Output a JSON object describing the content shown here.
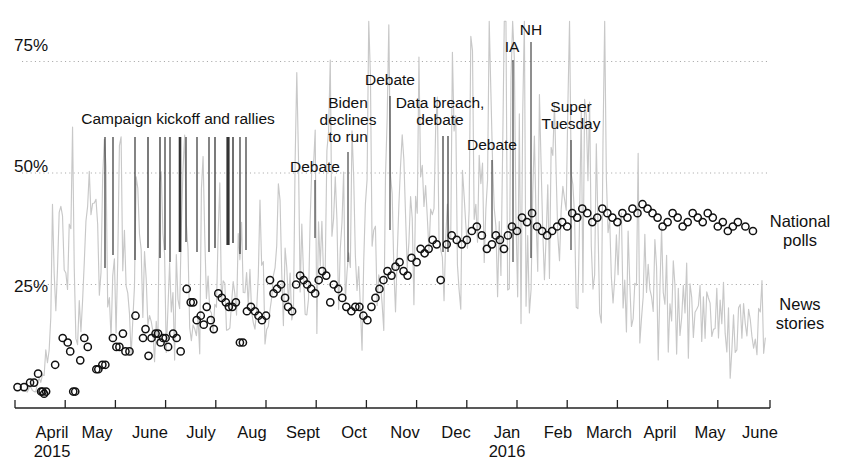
{
  "chart_data": {
    "type": "line",
    "title": "",
    "xlabel": "",
    "ylabel": "",
    "ylim": [
      0,
      85
    ],
    "grid": "horizontal dotted at 25%, 50%, 75%",
    "legend_position": "right, inline at series end",
    "y_ticks": [
      {
        "label": "75%",
        "value": 75
      },
      {
        "label": "50%",
        "value": 50
      },
      {
        "label": "25%",
        "value": 25
      }
    ],
    "x_ticks": [
      {
        "label": "April",
        "sub": "2015",
        "value": "2015-04"
      },
      {
        "label": "May",
        "sub": "",
        "value": "2015-05"
      },
      {
        "label": "June",
        "sub": "",
        "value": "2015-06"
      },
      {
        "label": "July",
        "sub": "",
        "value": "2015-07"
      },
      {
        "label": "Aug",
        "sub": "",
        "value": "2015-08"
      },
      {
        "label": "Sept",
        "sub": "",
        "value": "2015-09"
      },
      {
        "label": "Oct",
        "sub": "",
        "value": "2015-10"
      },
      {
        "label": "Nov",
        "sub": "",
        "value": "2015-11"
      },
      {
        "label": "Dec",
        "sub": "",
        "value": "2015-12"
      },
      {
        "label": "Jan",
        "sub": "2016",
        "value": "2016-01"
      },
      {
        "label": "Feb",
        "sub": "",
        "value": "2016-02"
      },
      {
        "label": "March",
        "sub": "",
        "value": "2016-03"
      },
      {
        "label": "April",
        "sub": "",
        "value": "2016-04"
      },
      {
        "label": "May",
        "sub": "",
        "value": "2016-05"
      },
      {
        "label": "June",
        "sub": "",
        "value": "2016-06"
      }
    ],
    "series": [
      {
        "name": "National polls",
        "type": "scatter",
        "marker": "open-circle",
        "color": "#111111",
        "label_text": "National\npolls",
        "points": [
          [
            0.05,
            2
          ],
          [
            0.18,
            2
          ],
          [
            0.3,
            3
          ],
          [
            0.38,
            3
          ],
          [
            0.46,
            5
          ],
          [
            0.52,
            1
          ],
          [
            0.55,
            1
          ],
          [
            0.58,
            0.5
          ],
          [
            0.62,
            1
          ],
          [
            0.8,
            7
          ],
          [
            0.95,
            13
          ],
          [
            1.05,
            12
          ],
          [
            1.1,
            10
          ],
          [
            1.16,
            1
          ],
          [
            1.2,
            1
          ],
          [
            1.3,
            8
          ],
          [
            1.38,
            13
          ],
          [
            1.45,
            11
          ],
          [
            1.62,
            6
          ],
          [
            1.66,
            6
          ],
          [
            1.74,
            7
          ],
          [
            1.8,
            7
          ],
          [
            1.95,
            13
          ],
          [
            2.02,
            11
          ],
          [
            2.08,
            11
          ],
          [
            2.15,
            14
          ],
          [
            2.2,
            10
          ],
          [
            2.28,
            10
          ],
          [
            2.4,
            18
          ],
          [
            2.55,
            13
          ],
          [
            2.6,
            15
          ],
          [
            2.66,
            9
          ],
          [
            2.72,
            13
          ],
          [
            2.8,
            14
          ],
          [
            2.85,
            14
          ],
          [
            2.9,
            12
          ],
          [
            2.95,
            13
          ],
          [
            3.0,
            13
          ],
          [
            3.05,
            11
          ],
          [
            3.15,
            14
          ],
          [
            3.22,
            13
          ],
          [
            3.3,
            10
          ],
          [
            3.42,
            24
          ],
          [
            3.5,
            21
          ],
          [
            3.55,
            21
          ],
          [
            3.62,
            17
          ],
          [
            3.7,
            18
          ],
          [
            3.76,
            16
          ],
          [
            3.82,
            20
          ],
          [
            3.9,
            17
          ],
          [
            3.96,
            15
          ],
          [
            4.05,
            23
          ],
          [
            4.12,
            22
          ],
          [
            4.2,
            21
          ],
          [
            4.26,
            20
          ],
          [
            4.33,
            20
          ],
          [
            4.4,
            21
          ],
          [
            4.48,
            12
          ],
          [
            4.54,
            12
          ],
          [
            4.62,
            19
          ],
          [
            4.7,
            20
          ],
          [
            4.78,
            19
          ],
          [
            4.85,
            18
          ],
          [
            4.92,
            17
          ],
          [
            5.0,
            18
          ],
          [
            5.08,
            26
          ],
          [
            5.15,
            23
          ],
          [
            5.22,
            24
          ],
          [
            5.3,
            25
          ],
          [
            5.38,
            22
          ],
          [
            5.44,
            20
          ],
          [
            5.52,
            19
          ],
          [
            5.6,
            25
          ],
          [
            5.68,
            27
          ],
          [
            5.75,
            26
          ],
          [
            5.82,
            25
          ],
          [
            5.9,
            24
          ],
          [
            5.98,
            23
          ],
          [
            6.05,
            26
          ],
          [
            6.12,
            28
          ],
          [
            6.2,
            27
          ],
          [
            6.28,
            21
          ],
          [
            6.35,
            25
          ],
          [
            6.44,
            24
          ],
          [
            6.52,
            22
          ],
          [
            6.6,
            20
          ],
          [
            6.7,
            19
          ],
          [
            6.78,
            20
          ],
          [
            6.86,
            20
          ],
          [
            6.94,
            18
          ],
          [
            7.02,
            17
          ],
          [
            7.1,
            20
          ],
          [
            7.18,
            22
          ],
          [
            7.26,
            24
          ],
          [
            7.34,
            26
          ],
          [
            7.42,
            28
          ],
          [
            7.5,
            27
          ],
          [
            7.58,
            29
          ],
          [
            7.66,
            30
          ],
          [
            7.74,
            28
          ],
          [
            7.82,
            27
          ],
          [
            7.9,
            31
          ],
          [
            8.0,
            30
          ],
          [
            8.08,
            33
          ],
          [
            8.16,
            32
          ],
          [
            8.24,
            33
          ],
          [
            8.32,
            35
          ],
          [
            8.4,
            34
          ],
          [
            8.48,
            26
          ],
          [
            8.6,
            34
          ],
          [
            8.7,
            36
          ],
          [
            8.8,
            35
          ],
          [
            8.9,
            34
          ],
          [
            9.0,
            35
          ],
          [
            9.1,
            37
          ],
          [
            9.2,
            38
          ],
          [
            9.3,
            36
          ],
          [
            9.4,
            33
          ],
          [
            9.5,
            34
          ],
          [
            9.58,
            36
          ],
          [
            9.66,
            35
          ],
          [
            9.74,
            33
          ],
          [
            9.82,
            36
          ],
          [
            9.9,
            38
          ],
          [
            10.0,
            37
          ],
          [
            10.1,
            40
          ],
          [
            10.2,
            39
          ],
          [
            10.3,
            41
          ],
          [
            10.4,
            38
          ],
          [
            10.5,
            37
          ],
          [
            10.6,
            36
          ],
          [
            10.7,
            37
          ],
          [
            10.8,
            38
          ],
          [
            10.9,
            39
          ],
          [
            11.0,
            38
          ],
          [
            11.1,
            41
          ],
          [
            11.2,
            40
          ],
          [
            11.3,
            42
          ],
          [
            11.4,
            41
          ],
          [
            11.5,
            39
          ],
          [
            11.6,
            40
          ],
          [
            11.7,
            42
          ],
          [
            11.8,
            41
          ],
          [
            11.9,
            40
          ],
          [
            12.0,
            39
          ],
          [
            12.1,
            41
          ],
          [
            12.2,
            40
          ],
          [
            12.3,
            42
          ],
          [
            12.4,
            41
          ],
          [
            12.5,
            43
          ],
          [
            12.6,
            42
          ],
          [
            12.7,
            41
          ],
          [
            12.8,
            40
          ],
          [
            12.9,
            38
          ],
          [
            13.0,
            39
          ],
          [
            13.1,
            41
          ],
          [
            13.2,
            40
          ],
          [
            13.3,
            38
          ],
          [
            13.4,
            39
          ],
          [
            13.5,
            41
          ],
          [
            13.6,
            40
          ],
          [
            13.7,
            39
          ],
          [
            13.8,
            41
          ],
          [
            13.9,
            40
          ],
          [
            14.0,
            38
          ],
          [
            14.1,
            39
          ],
          [
            14.2,
            37
          ],
          [
            14.3,
            38
          ],
          [
            14.4,
            39
          ],
          [
            14.55,
            38
          ],
          [
            14.7,
            37
          ]
        ]
      },
      {
        "name": "News stories",
        "type": "line",
        "color": "#c9c9c9",
        "label_text": "News\nstories"
      }
    ],
    "annotations": [
      {
        "text": "Campaign kickoff and rallies",
        "x_label_center": 178,
        "y_label_top": 110
      },
      {
        "text": "Debate",
        "x_label_center": 315,
        "y_label_top": 158
      },
      {
        "text": "Biden\ndeclines\nto run",
        "x_label_center": 348,
        "y_label_top": 94
      },
      {
        "text": "Debate",
        "x_label_center": 390,
        "y_label_top": 71
      },
      {
        "text": "Data breach,\ndebate",
        "x_label_center": 440,
        "y_label_top": 94
      },
      {
        "text": "Debate",
        "x_label_center": 492,
        "y_label_top": 136
      },
      {
        "text": "IA",
        "x_label_center": 512,
        "y_label_top": 38
      },
      {
        "text": "NH",
        "x_label_center": 531,
        "y_label_top": 21
      },
      {
        "text": "Super\nTuesday",
        "x_label_center": 571,
        "y_label_top": 98
      }
    ],
    "event_ticks_campaign": [
      104,
      112,
      134,
      147,
      160,
      164,
      169,
      178,
      185,
      195,
      209,
      216,
      224,
      232,
      238,
      242,
      248
    ]
  },
  "series_labels": {
    "national_polls": "National\npolls",
    "news_stories": "News\nstories"
  }
}
